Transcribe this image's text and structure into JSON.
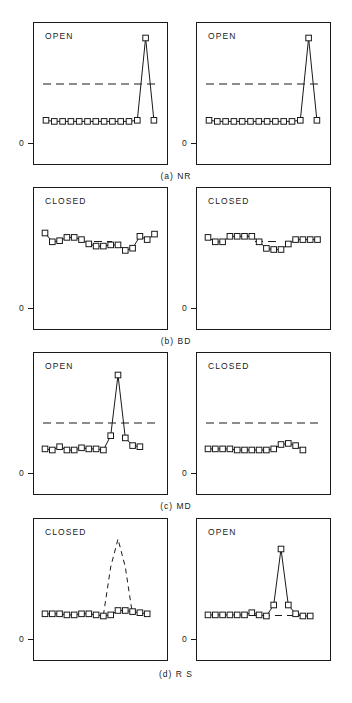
{
  "figure": {
    "axis_zero_label": "0",
    "rows": [
      {
        "caption": "(a)  NR",
        "panels": [
          {
            "state": "OPEN",
            "series": {
              "type": "line",
              "marker": "open-square",
              "linestyle": "solid",
              "x": [
                0,
                1,
                2,
                3,
                4,
                5,
                6,
                7,
                8,
                9,
                10,
                11,
                12,
                13
              ],
              "values": [
                2,
                1,
                1,
                1,
                1,
                1,
                1,
                1,
                1,
                1,
                1,
                2,
                97,
                2
              ]
            },
            "reference_line": {
              "linestyle": "dashed",
              "value": 62
            }
          },
          {
            "state": "OPEN",
            "series": {
              "type": "line",
              "marker": "open-square",
              "linestyle": "solid",
              "x": [
                0,
                1,
                2,
                3,
                4,
                5,
                6,
                7,
                8,
                9,
                10,
                11,
                12,
                13
              ],
              "values": [
                2,
                1,
                1,
                1,
                1,
                1,
                1,
                1,
                1,
                1,
                1,
                2,
                97,
                2
              ]
            },
            "reference_line": {
              "linestyle": "dashed",
              "value": 62
            }
          }
        ]
      },
      {
        "caption": "(b)  BD",
        "panels": [
          {
            "state": "CLOSED",
            "series": {
              "type": "line",
              "marker": "open-square",
              "linestyle": "solid",
              "x": [
                0,
                1,
                2,
                3,
                4,
                5,
                6,
                7,
                8,
                9,
                10,
                11,
                12,
                13,
                14,
                15
              ],
              "values": [
                74,
                66,
                67,
                70,
                70,
                68,
                64,
                62,
                62,
                63,
                63,
                58,
                60,
                71,
                68,
                72
              ]
            },
            "reference_line": {
              "linestyle": "dashed",
              "value": 66
            }
          },
          {
            "state": "CLOSED",
            "series": {
              "type": "line",
              "marker": "open-square",
              "linestyle": "solid",
              "x": [
                0,
                1,
                2,
                3,
                4,
                5,
                6,
                7,
                8,
                9,
                10,
                11,
                12,
                13,
                14,
                15
              ],
              "values": [
                70,
                66,
                66,
                71,
                71,
                71,
                71,
                66,
                60,
                59,
                59,
                64,
                68,
                68,
                68,
                68
              ]
            },
            "reference_line": {
              "linestyle": "dashed",
              "value": 66
            }
          }
        ]
      },
      {
        "caption": "(c)  MD",
        "panels": [
          {
            "state": "OPEN",
            "series": {
              "type": "line",
              "marker": "open-square",
              "linestyle": "solid",
              "x": [
                0,
                1,
                2,
                3,
                4,
                5,
                6,
                7,
                8,
                9,
                10,
                11,
                12,
                13
              ],
              "values": [
                3,
                2,
                5,
                2,
                2,
                4,
                3,
                3,
                2,
                15,
                88,
                13,
                6,
                5
              ]
            },
            "reference_line": {
              "linestyle": "dashed",
              "value": 48
            }
          },
          {
            "state": "CLOSED",
            "series": {
              "type": "line",
              "marker": "open-square",
              "linestyle": "solid",
              "x": [
                0,
                1,
                2,
                3,
                4,
                5,
                6,
                7,
                8,
                9,
                10,
                11,
                12,
                13
              ],
              "values": [
                3,
                3,
                3,
                3,
                2,
                2,
                2,
                2,
                2,
                3,
                7,
                8,
                6,
                2
              ]
            },
            "reference_line": {
              "linestyle": "dashed",
              "value": 48
            }
          }
        ]
      },
      {
        "caption": "(d)  R S",
        "panels": [
          {
            "state": "CLOSED",
            "series": {
              "type": "line",
              "marker": "open-square",
              "linestyle": "solid",
              "x": [
                0,
                1,
                2,
                3,
                4,
                5,
                6,
                7,
                8,
                9,
                10,
                11,
                12,
                13,
                14
              ],
              "values": [
                4,
                4,
                4,
                3,
                3,
                4,
                4,
                3,
                2,
                3,
                7,
                7,
                6,
                5,
                4
              ]
            },
            "reference_line": {
              "linestyle": "dashed",
              "type": "peak",
              "x": [
                8.4,
                9.0,
                9.6,
                10.2,
                10.8
              ],
              "values": [
                2,
                40,
                80,
                40,
                2
              ]
            }
          },
          {
            "state": "OPEN",
            "series": {
              "type": "line",
              "marker": "open-square",
              "linestyle": "solid",
              "x": [
                0,
                1,
                2,
                3,
                4,
                5,
                6,
                7,
                8,
                9,
                10,
                11,
                12,
                13,
                14
              ],
              "values": [
                3,
                3,
                3,
                3,
                3,
                3,
                5,
                3,
                2,
                12,
                72,
                12,
                4,
                2,
                2
              ]
            },
            "reference_line": {
              "linestyle": "dashed",
              "value": 4
            }
          }
        ]
      }
    ]
  }
}
